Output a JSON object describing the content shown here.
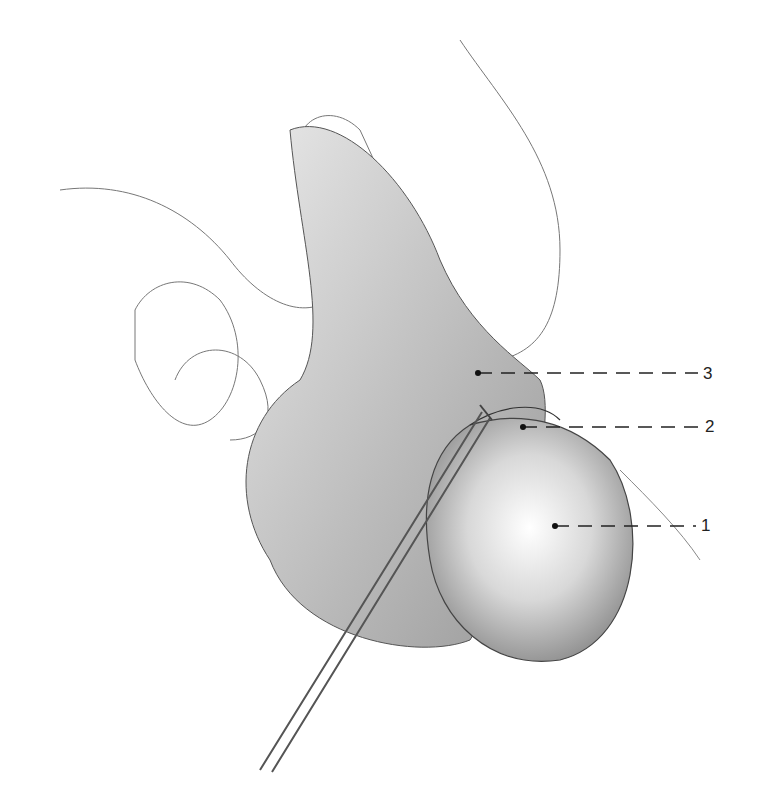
{
  "figure": {
    "labels": [
      {
        "number": "1",
        "x": 701,
        "y": 520,
        "dot_x": 555,
        "dot_y": 526
      },
      {
        "number": "2",
        "x": 705,
        "y": 418,
        "dot_x": 523,
        "dot_y": 427
      },
      {
        "number": "3",
        "x": 703,
        "y": 365,
        "dot_x": 478,
        "dot_y": 373
      }
    ]
  }
}
